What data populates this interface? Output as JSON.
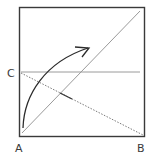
{
  "diagram": {
    "type": "origami-fold-step",
    "labels": {
      "a": "A",
      "b": "B",
      "c": "C"
    },
    "elements": {
      "square": "paper square outline",
      "diagonal": "diagonal crease from A to top-right corner",
      "horizontal_crease": "horizontal crease through C",
      "fold_line": "dotted valley fold from C to B",
      "crease_mark": "short crease mark on fold line",
      "arrow": "curved fold arrow from A upward to the right"
    },
    "colors": {
      "outline": "#3a3a3a",
      "crease": "#9a9a9a",
      "arrow": "#2b2b2b",
      "dotted": "#7a7a7a"
    }
  }
}
